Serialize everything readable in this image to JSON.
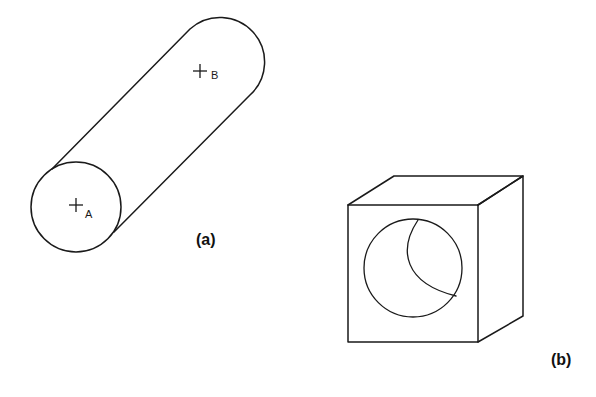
{
  "sheet": {
    "width": 596,
    "height": 397,
    "background_color": "#ffffff",
    "line_color": "#1a1a1a"
  },
  "figures": [
    {
      "id": "figure-a",
      "caption": "(a)",
      "subject": "cylinder",
      "description": "Cylindrical rod drawn in oblique pictorial view, axis inclined up to the right; near end is a full circle, far end is a rounded cap.",
      "points": [
        {
          "name": "A",
          "label": "A",
          "marker": "+",
          "location": "center of near circular end face",
          "x": 76,
          "y": 207
        },
        {
          "name": "B",
          "label": "B",
          "marker": "+",
          "location": "on curved surface near far rounded end",
          "x": 200,
          "y": 73
        }
      ],
      "geometry": {
        "near_circle": {
          "cx": 76,
          "cy": 207,
          "r": 45
        },
        "axis_angle_deg": -45,
        "upper_element_line": {
          "x1": 52,
          "y1": 169,
          "x2": 190,
          "y2": 29
        },
        "lower_element_line": {
          "x1": 114,
          "y1": 232,
          "x2": 250,
          "y2": 95
        },
        "far_cap": "arc from (190,29) to (250,95)"
      }
    },
    {
      "id": "figure-b",
      "caption": "(b)",
      "subject": "cube-with-hole",
      "description": "Cube drawn in oblique pictorial view with a circular through-hole bored in the front face; the far rim of the bore is visible as a crescent arc inside the hole.",
      "geometry": {
        "front_face": {
          "left": 348,
          "top": 205,
          "right": 478,
          "bottom": 342
        },
        "top_back_left": {
          "x": 394,
          "y": 176
        },
        "top_back_right": {
          "x": 523,
          "y": 176
        },
        "bottom_back_right": {
          "x": 523,
          "y": 316
        },
        "hole_circle": {
          "cx": 413,
          "cy": 268,
          "r": 49
        },
        "inner_arc": "crescent arc from (418,220) to (456,296)"
      }
    }
  ],
  "labels": {
    "point_a": "A",
    "point_b": "B",
    "caption_a": "(a)",
    "caption_b": "(b)",
    "marker_glyph": "+"
  }
}
